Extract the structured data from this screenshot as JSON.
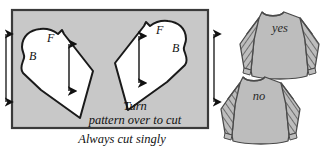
{
  "diagram": {
    "fabric_layout": {
      "name": "fabric-rectangle",
      "fill_color": "#c8c8c8",
      "border_color": "#333333",
      "selvage_arrow_left": "grainline-arrow-left-selvage",
      "selvage_arrow_right": "grainline-arrow-right-selvage",
      "instruction_line1": "Turn",
      "instruction_line2": "pattern over to cut"
    },
    "pattern_pieces": [
      {
        "name": "pattern-piece-left",
        "fill_color": "#ffffff",
        "outline_color": "#1a1a1a",
        "front_label": "F",
        "back_label": "B",
        "grainline": "grainline-double-arrow"
      },
      {
        "name": "pattern-piece-right",
        "fill_color": "#ffffff",
        "outline_color": "#1a1a1a",
        "front_label": "F",
        "back_label": "B",
        "grainline": "grainline-double-arrow"
      }
    ],
    "caption": "Always cut singly",
    "garments": [
      {
        "name": "garment-correct",
        "label": "yes",
        "fill_color": "#bdbdbd",
        "outline_color": "#4a4a4a",
        "stripe_direction": "mirrored"
      },
      {
        "name": "garment-incorrect",
        "label": "no",
        "fill_color": "#bdbdbd",
        "outline_color": "#4a4a4a",
        "stripe_direction": "same-direction"
      }
    ]
  }
}
